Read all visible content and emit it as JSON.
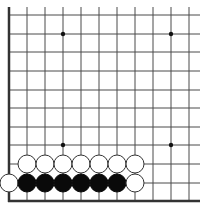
{
  "board": {
    "description": "Go board corner (lower-left), partial view",
    "edges": [
      "left",
      "bottom"
    ],
    "grid": {
      "columns_x": [
        9,
        27,
        45,
        63,
        81,
        99,
        117,
        135,
        153,
        171,
        189
      ],
      "rows_y": [
        15,
        34,
        52,
        71,
        90,
        108,
        127,
        145,
        164,
        183
      ],
      "bottom_edge_y": 201,
      "left_edge_x": 9,
      "line_extent_right": 200,
      "line_extent_top": 7,
      "line_color": "#4a4a4a",
      "edge_color": "#333333"
    },
    "star_points": [
      {
        "x": 63,
        "y": 34
      },
      {
        "x": 171,
        "y": 34
      },
      {
        "x": 63,
        "y": 145
      },
      {
        "x": 171,
        "y": 145
      }
    ],
    "stones": [
      {
        "color": "white",
        "x": 27,
        "y": 164
      },
      {
        "color": "white",
        "x": 45,
        "y": 164
      },
      {
        "color": "white",
        "x": 63,
        "y": 164
      },
      {
        "color": "white",
        "x": 81,
        "y": 164
      },
      {
        "color": "white",
        "x": 99,
        "y": 164
      },
      {
        "color": "white",
        "x": 117,
        "y": 164
      },
      {
        "color": "white",
        "x": 135,
        "y": 164
      },
      {
        "color": "white",
        "x": 9,
        "y": 183
      },
      {
        "color": "black",
        "x": 27,
        "y": 183
      },
      {
        "color": "black",
        "x": 45,
        "y": 183
      },
      {
        "color": "black",
        "x": 63,
        "y": 183
      },
      {
        "color": "black",
        "x": 81,
        "y": 183
      },
      {
        "color": "black",
        "x": 99,
        "y": 183
      },
      {
        "color": "black",
        "x": 117,
        "y": 183
      },
      {
        "color": "white",
        "x": 135,
        "y": 183
      }
    ],
    "stone_radius": 9,
    "colors": {
      "black_stone": "#0a0a0a",
      "white_stone": "#ffffff",
      "white_stone_outline": "#333333",
      "background": "#ffffff"
    }
  }
}
